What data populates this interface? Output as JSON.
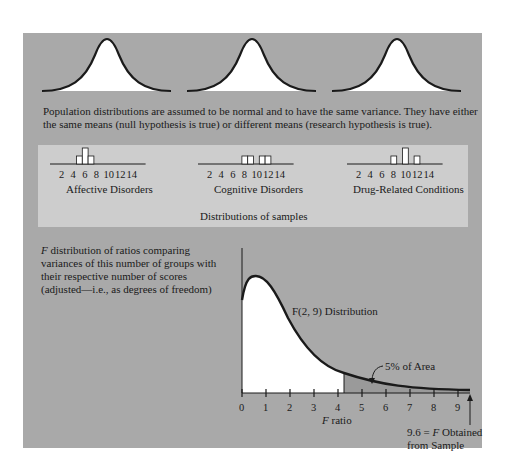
{
  "populations": {
    "caption_line1": "Population distributions are assumed to be normal and to have the same variance. They have either",
    "caption_line2": "the same means (null hypothesis is true) or different means (research hypothesis is true)."
  },
  "samples": {
    "title": "Distributions of samples",
    "tick_labels": [
      "2",
      "4",
      "6",
      "8",
      "10",
      "12",
      "14"
    ],
    "groups": [
      {
        "name": "Affective Disorders",
        "bars": [
          {
            "x": 5,
            "h": 1
          },
          {
            "x": 6,
            "h": 2
          },
          {
            "x": 7,
            "h": 1
          }
        ]
      },
      {
        "name": "Cognitive Disorders",
        "bars": [
          {
            "x": 8,
            "h": 1
          },
          {
            "x": 9,
            "h": 1
          },
          {
            "x": 11,
            "h": 1
          },
          {
            "x": 12,
            "h": 1
          }
        ]
      },
      {
        "name": "Drug-Related Conditions",
        "bars": [
          {
            "x": 8,
            "h": 1
          },
          {
            "x": 10,
            "h": 2
          },
          {
            "x": 12,
            "h": 1
          }
        ]
      }
    ]
  },
  "f_dist": {
    "description_line1": "distribution of ratios comparing",
    "description_f": "F",
    "description_line2": "variances of this number of groups with",
    "description_line3": "their respective number of scores",
    "description_line4": "(adjusted—i.e., as degrees of freedom)",
    "curve_label": "F(2, 9) Distribution",
    "tail_label": "5% of Area",
    "axis_label_f": "F",
    "axis_label": "ratio",
    "ticks": [
      "0",
      "1",
      "2",
      "3",
      "4",
      "5",
      "6",
      "7",
      "8",
      "9"
    ],
    "obtained_line1_pre": "9.6 = ",
    "obtained_line1_f": "F",
    "obtained_line1_post": " Obtained",
    "obtained_line2": "from Sample"
  },
  "colors": {
    "panel": "#a9a9a9",
    "inner": "#cdcdcd",
    "tail": "#9a9a9a",
    "curve": "#1a1a1a"
  }
}
